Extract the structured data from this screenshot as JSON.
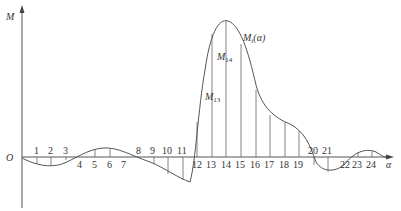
{
  "axes": {
    "y_label": "M",
    "x_label": "α",
    "origin_label": "O"
  },
  "curve": {
    "label_main": "M",
    "label_sub": "i",
    "label_arg": "(α)"
  },
  "annotations": [
    {
      "main": "M",
      "sub": "14"
    },
    {
      "main": "M",
      "sub": "13"
    }
  ],
  "ticks": [
    "1",
    "2",
    "3",
    "4",
    "5",
    "6",
    "7",
    "8",
    "9",
    "10",
    "11",
    "12",
    "13",
    "14",
    "15",
    "16",
    "17",
    "18",
    "19",
    "20",
    "21",
    "22",
    "23",
    "24"
  ],
  "colors": {
    "line": "#555555",
    "text": "#333333",
    "background": "#ffffff"
  }
}
